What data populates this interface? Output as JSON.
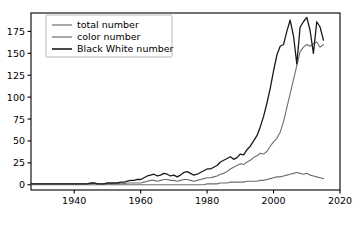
{
  "chart_data": {
    "type": "line",
    "title": "",
    "xlabel": "",
    "ylabel": "",
    "xlim": [
      1927,
      2020
    ],
    "ylim": [
      -6,
      196
    ],
    "grid": false,
    "legend_position": "upper left",
    "xticks": [
      1940,
      1960,
      1980,
      2000,
      2020
    ],
    "yticks": [
      0,
      25,
      50,
      75,
      100,
      125,
      150,
      175
    ],
    "colors": {
      "total number": "#6e6e6e",
      "color number": "#6e6e6e",
      "Black White number": "#1a1a1a",
      "axes": "#000000",
      "legend_frame": "#b0b0b0",
      "background": "#ffffff"
    },
    "x": [
      1927,
      1928,
      1929,
      1930,
      1931,
      1932,
      1933,
      1934,
      1935,
      1936,
      1937,
      1938,
      1939,
      1940,
      1941,
      1942,
      1943,
      1944,
      1945,
      1946,
      1947,
      1948,
      1949,
      1950,
      1951,
      1952,
      1953,
      1954,
      1955,
      1956,
      1957,
      1958,
      1959,
      1960,
      1961,
      1962,
      1963,
      1964,
      1965,
      1966,
      1967,
      1968,
      1969,
      1970,
      1971,
      1972,
      1973,
      1974,
      1975,
      1976,
      1977,
      1978,
      1979,
      1980,
      1981,
      1982,
      1983,
      1984,
      1985,
      1986,
      1987,
      1988,
      1989,
      1990,
      1991,
      1992,
      1993,
      1994,
      1995,
      1996,
      1997,
      1998,
      1999,
      2000,
      2001,
      2002,
      2003,
      2004,
      2005,
      2006,
      2007,
      2008,
      2009,
      2010,
      2011,
      2012,
      2013,
      2014,
      2015
    ],
    "series": [
      {
        "name": "total number",
        "values": [
          1,
          1,
          1,
          1,
          1,
          1,
          1,
          1,
          1,
          1,
          1,
          1,
          1,
          1,
          1,
          1,
          1,
          1,
          1,
          2,
          1,
          1,
          1,
          1,
          1,
          1,
          1,
          2,
          1,
          2,
          2,
          2,
          2,
          2,
          3,
          4,
          5,
          5,
          4,
          5,
          6,
          6,
          5,
          5,
          4,
          5,
          6,
          6,
          5,
          4,
          5,
          6,
          7,
          8,
          8,
          9,
          10,
          12,
          13,
          15,
          18,
          20,
          22,
          24,
          23,
          26,
          28,
          31,
          33,
          36,
          35,
          38,
          44,
          49,
          53,
          60,
          72,
          88,
          104,
          120,
          136,
          152,
          157,
          160,
          158,
          161,
          163,
          157,
          160
        ]
      },
      {
        "name": "color number",
        "values": [
          0,
          0,
          0,
          0,
          0,
          0,
          0,
          0,
          0,
          0,
          0,
          0,
          0,
          0,
          0,
          0,
          0,
          0,
          0,
          0,
          0,
          0,
          0,
          0,
          0,
          0,
          0,
          0,
          0,
          0,
          0,
          0,
          0,
          0,
          0,
          0,
          0,
          0,
          0,
          0,
          0,
          0,
          0,
          0,
          0,
          0,
          0,
          0,
          0,
          0,
          0,
          0,
          0,
          1,
          1,
          1,
          1,
          2,
          2,
          2,
          3,
          3,
          3,
          3,
          3,
          4,
          4,
          4,
          4,
          5,
          5,
          6,
          7,
          8,
          9,
          9,
          10,
          11,
          12,
          13,
          14,
          13,
          12,
          13,
          11,
          10,
          9,
          8,
          7
        ]
      },
      {
        "name": "Black White number",
        "values": [
          1,
          1,
          1,
          1,
          1,
          1,
          1,
          1,
          1,
          1,
          1,
          1,
          1,
          1,
          1,
          1,
          1,
          1,
          2,
          2,
          1,
          1,
          1,
          2,
          2,
          2,
          2,
          3,
          3,
          4,
          5,
          5,
          6,
          6,
          8,
          10,
          11,
          12,
          10,
          11,
          13,
          12,
          10,
          11,
          9,
          11,
          14,
          15,
          13,
          11,
          12,
          14,
          16,
          18,
          18,
          20,
          22,
          26,
          28,
          30,
          32,
          29,
          31,
          35,
          34,
          40,
          44,
          50,
          56,
          66,
          78,
          93,
          110,
          130,
          148,
          158,
          160,
          175,
          188,
          170,
          138,
          180,
          186,
          191,
          176,
          150,
          186,
          180,
          165
        ]
      }
    ],
    "legend_entries": [
      "total number",
      "color number",
      "Black White number"
    ]
  }
}
